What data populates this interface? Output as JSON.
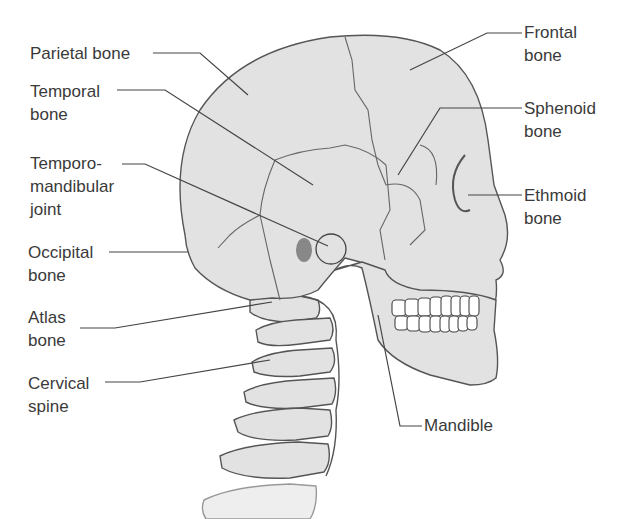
{
  "diagram": {
    "colors": {
      "bone_fill": "#e2e2e2",
      "outline": "#555555",
      "leader_line": "#444444",
      "text": "#3a3a3a",
      "teeth": "#ffffff"
    },
    "labels": {
      "parietal": {
        "line1": "Parietal bone",
        "line2": ""
      },
      "temporal": {
        "line1": "Temporal",
        "line2": "bone"
      },
      "tmj": {
        "line1": "Temporo-",
        "line2": "mandibular",
        "line3": "joint"
      },
      "occipital": {
        "line1": "Occipital",
        "line2": "bone"
      },
      "atlas": {
        "line1": "Atlas",
        "line2": "bone"
      },
      "cervical": {
        "line1": "Cervical",
        "line2": "spine"
      },
      "frontal": {
        "line1": "Frontal",
        "line2": "bone"
      },
      "sphenoid": {
        "line1": "Sphenoid",
        "line2": "bone"
      },
      "ethmoid": {
        "line1": "Ethmoid",
        "line2": "bone"
      },
      "mandible": {
        "line1": "Mandible"
      }
    }
  }
}
